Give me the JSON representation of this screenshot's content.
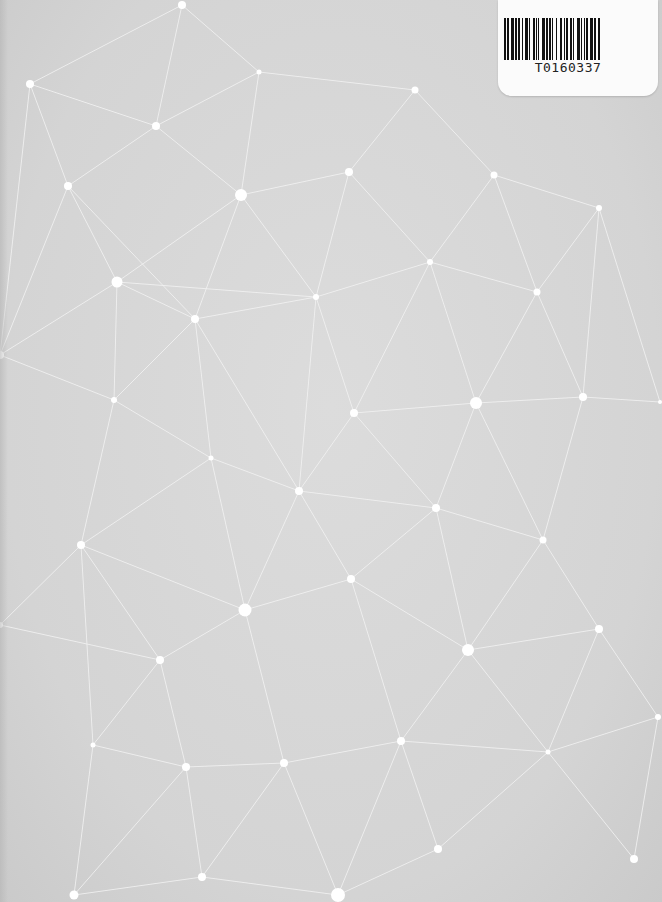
{
  "cover": {
    "background_color": "#d6d6d6",
    "line_color": "#f2f2f2",
    "node_color": "#ffffff"
  },
  "barcode_label": {
    "code": "T0160337",
    "bars": [
      2,
      1,
      1,
      2,
      3,
      1,
      1,
      1,
      2,
      2,
      1,
      1,
      3,
      1,
      1,
      2,
      2,
      1,
      1,
      1,
      1,
      2,
      3,
      1,
      1,
      1,
      2,
      1,
      1,
      2,
      1,
      3,
      2,
      1,
      1,
      1,
      2,
      2,
      1,
      1,
      1,
      3,
      2,
      1,
      1,
      2,
      1,
      1,
      1,
      2,
      3,
      1,
      1,
      2,
      2,
      1
    ]
  },
  "network": {
    "nodes": [
      {
        "id": 0,
        "x": 182,
        "y": 5,
        "r": 4
      },
      {
        "id": 1,
        "x": 30,
        "y": 84,
        "r": 4
      },
      {
        "id": 2,
        "x": 259,
        "y": 72,
        "r": 2.5
      },
      {
        "id": 3,
        "x": 415,
        "y": 90,
        "r": 3.5
      },
      {
        "id": 4,
        "x": 156,
        "y": 126,
        "r": 4
      },
      {
        "id": 5,
        "x": 68,
        "y": 186,
        "r": 4
      },
      {
        "id": 6,
        "x": 241,
        "y": 195,
        "r": 6
      },
      {
        "id": 7,
        "x": 349,
        "y": 172,
        "r": 4
      },
      {
        "id": 8,
        "x": 494,
        "y": 175,
        "r": 3.5
      },
      {
        "id": 9,
        "x": 599,
        "y": 208,
        "r": 3
      },
      {
        "id": 10,
        "x": 117,
        "y": 282,
        "r": 5.5
      },
      {
        "id": 11,
        "x": 430,
        "y": 262,
        "r": 3
      },
      {
        "id": 12,
        "x": 537,
        "y": 292,
        "r": 3.5
      },
      {
        "id": 13,
        "x": 316,
        "y": 297,
        "r": 3
      },
      {
        "id": 14,
        "x": 195,
        "y": 319,
        "r": 4
      },
      {
        "id": 15,
        "x": 476,
        "y": 403,
        "r": 6
      },
      {
        "id": 16,
        "x": 583,
        "y": 397,
        "r": 4
      },
      {
        "id": 17,
        "x": 114,
        "y": 400,
        "r": 3
      },
      {
        "id": 18,
        "x": 354,
        "y": 413,
        "r": 4
      },
      {
        "id": 19,
        "x": 211,
        "y": 458,
        "r": 2.5
      },
      {
        "id": 20,
        "x": 299,
        "y": 491,
        "r": 4
      },
      {
        "id": 21,
        "x": 436,
        "y": 508,
        "r": 4
      },
      {
        "id": 22,
        "x": 81,
        "y": 545,
        "r": 4
      },
      {
        "id": 23,
        "x": 543,
        "y": 540,
        "r": 3.5
      },
      {
        "id": 24,
        "x": 351,
        "y": 579,
        "r": 4
      },
      {
        "id": 25,
        "x": 245,
        "y": 610,
        "r": 6.5
      },
      {
        "id": 26,
        "x": 599,
        "y": 629,
        "r": 4
      },
      {
        "id": 27,
        "x": 468,
        "y": 650,
        "r": 6
      },
      {
        "id": 28,
        "x": 160,
        "y": 660,
        "r": 4
      },
      {
        "id": 29,
        "x": 93,
        "y": 745,
        "r": 2.5
      },
      {
        "id": 30,
        "x": 401,
        "y": 741,
        "r": 4
      },
      {
        "id": 31,
        "x": 186,
        "y": 767,
        "r": 4
      },
      {
        "id": 32,
        "x": 284,
        "y": 763,
        "r": 4
      },
      {
        "id": 33,
        "x": 548,
        "y": 752,
        "r": 2.5
      },
      {
        "id": 34,
        "x": 634,
        "y": 859,
        "r": 4
      },
      {
        "id": 35,
        "x": 438,
        "y": 849,
        "r": 4
      },
      {
        "id": 36,
        "x": 202,
        "y": 877,
        "r": 4
      },
      {
        "id": 37,
        "x": 74,
        "y": 895,
        "r": 4.5
      },
      {
        "id": 38,
        "x": 338,
        "y": 895,
        "r": 7
      },
      {
        "id": 39,
        "x": 658,
        "y": 717,
        "r": 3
      },
      {
        "id": 40,
        "x": 0,
        "y": 355,
        "r": 4
      },
      {
        "id": 41,
        "x": 660,
        "y": 402,
        "r": 2
      },
      {
        "id": 42,
        "x": 0,
        "y": 625,
        "r": 3
      }
    ],
    "edges": [
      [
        0,
        2
      ],
      [
        0,
        4
      ],
      [
        0,
        1
      ],
      [
        1,
        4
      ],
      [
        1,
        5
      ],
      [
        2,
        3
      ],
      [
        2,
        6
      ],
      [
        2,
        4
      ],
      [
        3,
        7
      ],
      [
        3,
        8
      ],
      [
        4,
        6
      ],
      [
        4,
        5
      ],
      [
        5,
        10
      ],
      [
        5,
        14
      ],
      [
        6,
        7
      ],
      [
        6,
        10
      ],
      [
        6,
        14
      ],
      [
        6,
        13
      ],
      [
        7,
        11
      ],
      [
        7,
        13
      ],
      [
        8,
        9
      ],
      [
        8,
        11
      ],
      [
        8,
        12
      ],
      [
        9,
        12
      ],
      [
        9,
        16
      ],
      [
        10,
        14
      ],
      [
        10,
        17
      ],
      [
        10,
        40
      ],
      [
        11,
        12
      ],
      [
        11,
        13
      ],
      [
        11,
        15
      ],
      [
        12,
        15
      ],
      [
        12,
        16
      ],
      [
        13,
        14
      ],
      [
        13,
        18
      ],
      [
        13,
        20
      ],
      [
        14,
        17
      ],
      [
        14,
        19
      ],
      [
        14,
        20
      ],
      [
        15,
        16
      ],
      [
        15,
        18
      ],
      [
        15,
        21
      ],
      [
        15,
        23
      ],
      [
        16,
        23
      ],
      [
        16,
        41
      ],
      [
        17,
        19
      ],
      [
        17,
        22
      ],
      [
        17,
        40
      ],
      [
        18,
        20
      ],
      [
        18,
        21
      ],
      [
        18,
        11
      ],
      [
        19,
        20
      ],
      [
        19,
        22
      ],
      [
        19,
        25
      ],
      [
        20,
        21
      ],
      [
        20,
        24
      ],
      [
        20,
        25
      ],
      [
        21,
        23
      ],
      [
        21,
        24
      ],
      [
        21,
        27
      ],
      [
        22,
        25
      ],
      [
        22,
        28
      ],
      [
        22,
        29
      ],
      [
        22,
        42
      ],
      [
        23,
        26
      ],
      [
        23,
        27
      ],
      [
        24,
        25
      ],
      [
        24,
        27
      ],
      [
        24,
        30
      ],
      [
        25,
        28
      ],
      [
        25,
        32
      ],
      [
        26,
        27
      ],
      [
        26,
        39
      ],
      [
        26,
        33
      ],
      [
        27,
        30
      ],
      [
        27,
        33
      ],
      [
        28,
        29
      ],
      [
        28,
        31
      ],
      [
        28,
        42
      ],
      [
        29,
        31
      ],
      [
        29,
        37
      ],
      [
        30,
        32
      ],
      [
        30,
        33
      ],
      [
        30,
        35
      ],
      [
        30,
        38
      ],
      [
        31,
        32
      ],
      [
        31,
        36
      ],
      [
        31,
        37
      ],
      [
        32,
        38
      ],
      [
        32,
        36
      ],
      [
        33,
        34
      ],
      [
        33,
        35
      ],
      [
        33,
        39
      ],
      [
        34,
        39
      ],
      [
        35,
        38
      ],
      [
        36,
        37
      ],
      [
        36,
        38
      ],
      [
        9,
        41
      ],
      [
        1,
        40
      ],
      [
        5,
        40
      ],
      [
        10,
        13
      ]
    ]
  }
}
